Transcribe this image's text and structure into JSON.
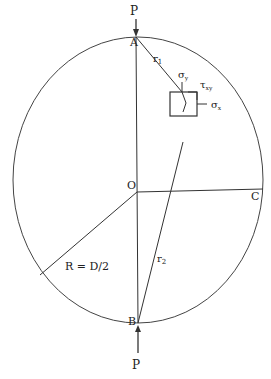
{
  "diagram": {
    "labels": {
      "load_top": "P",
      "load_bottom": "P",
      "point_a": "A",
      "point_b": "B",
      "point_c": "C",
      "center": "O",
      "r1": "r",
      "r1_sub": "1",
      "r2": "r",
      "r2_sub": "2",
      "sigma_y": "σ",
      "sigma_y_sub": "y",
      "sigma_x": "σ",
      "sigma_x_sub": "x",
      "tau_xy": "τ",
      "tau_xy_sub": "xy",
      "radius": "R = D/2"
    },
    "colors": {
      "stroke": "#333333",
      "background": "#ffffff"
    }
  }
}
